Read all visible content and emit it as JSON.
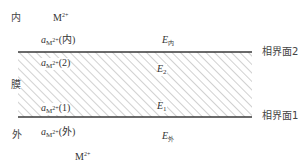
{
  "diagram": {
    "regions": {
      "inner_label": "内",
      "membrane_label": "膜",
      "outer_label": "外"
    },
    "ions": {
      "inner": {
        "base": "M",
        "charge": "2+"
      },
      "outer": {
        "base": "M",
        "charge": "2+"
      }
    },
    "activities": [
      {
        "id": "inner",
        "symbol": "a",
        "sub": "M",
        "sub_sup": "2+",
        "paren": "(内)"
      },
      {
        "id": "2",
        "symbol": "a",
        "sub": "M",
        "sub_sup": "2+",
        "paren": "(2)"
      },
      {
        "id": "1",
        "symbol": "a",
        "sub": "M",
        "sub_sup": "2+",
        "paren": "(1)"
      },
      {
        "id": "outer",
        "symbol": "a",
        "sub": "M",
        "sub_sup": "2+",
        "paren": "(外)"
      }
    ],
    "potentials": [
      {
        "id": "inner",
        "symbol": "E",
        "sub": "内"
      },
      {
        "id": "2",
        "symbol": "E",
        "sub": "2"
      },
      {
        "id": "1",
        "symbol": "E",
        "sub": "1"
      },
      {
        "id": "outer",
        "symbol": "E",
        "sub": "外"
      }
    ],
    "interfaces": [
      {
        "id": "2",
        "label": "相界面2"
      },
      {
        "id": "1",
        "label": "相界面1"
      }
    ],
    "colors": {
      "line": "#3a3a3a",
      "hatch": "#9a9a9a",
      "text": "#3a3a3a"
    }
  }
}
